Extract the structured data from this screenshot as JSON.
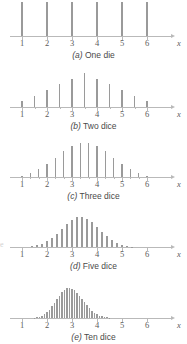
{
  "figure": {
    "title": "",
    "axis_color": "#b9b9b9",
    "bar_color": "#9a9a9a",
    "text_color": "#4a4a4a"
  },
  "chart_data": {
    "type": "bar",
    "xlabel": "x",
    "ylabel": "",
    "xlim": [
      0.5,
      6.8
    ],
    "grid": false,
    "legend": "none",
    "panels": [
      {
        "id": "a",
        "label": "(a)",
        "caption": "One die",
        "tick_labels": [
          "1",
          "2",
          "3",
          "4",
          "5",
          "6"
        ],
        "tick_values": [
          1,
          2,
          3,
          4,
          5,
          6
        ],
        "minor_ticks": [],
        "x": [
          1,
          2,
          3,
          4,
          5,
          6
        ],
        "values": [
          0.1667,
          0.1667,
          0.1667,
          0.1667,
          0.1667,
          0.1667
        ],
        "max_value": 0.1667,
        "bar_width_px": 1.3
      },
      {
        "id": "b",
        "label": "(b)",
        "caption": "Two dice",
        "tick_labels": [
          "1",
          "2",
          "3",
          "4",
          "5",
          "6"
        ],
        "tick_values": [
          1,
          2,
          3,
          4,
          5,
          6
        ],
        "minor_ticks": [
          1.5,
          2.5,
          3.5,
          4.5,
          5.5
        ],
        "x": [
          1,
          1.5,
          2,
          2.5,
          3,
          3.5,
          4,
          4.5,
          5,
          5.5,
          6
        ],
        "values": [
          0.0278,
          0.0556,
          0.0833,
          0.1111,
          0.1389,
          0.1667,
          0.1389,
          0.1111,
          0.0833,
          0.0556,
          0.0278
        ],
        "max_value": 0.1667,
        "bar_width_px": 1.3
      },
      {
        "id": "c",
        "label": "(c)",
        "caption": "Three dice",
        "tick_labels": [
          "1",
          "2",
          "3",
          "4",
          "5",
          "6"
        ],
        "tick_values": [
          1,
          2,
          3,
          4,
          5,
          6
        ],
        "minor_ticks": [
          1.333,
          1.667,
          2.333,
          2.667,
          3.333,
          3.667,
          4.333,
          4.667,
          5.333,
          5.667
        ],
        "x": [
          1,
          1.333,
          1.667,
          2,
          2.333,
          2.667,
          3,
          3.333,
          3.667,
          4,
          4.333,
          4.667,
          5,
          5.333,
          5.667,
          6
        ],
        "values": [
          0.00463,
          0.01389,
          0.02778,
          0.0463,
          0.06944,
          0.09722,
          0.11574,
          0.125,
          0.125,
          0.11574,
          0.09722,
          0.06944,
          0.0463,
          0.02778,
          0.01389,
          0.00463
        ],
        "max_value": 0.125,
        "bar_width_px": 1.3
      },
      {
        "id": "d",
        "label": "(d)",
        "caption": "Five dice",
        "tick_labels": [
          "1",
          "2",
          "3",
          "4",
          "5",
          "6"
        ],
        "tick_values": [
          1,
          2,
          3,
          4,
          5,
          6
        ],
        "minor_ticks": [],
        "x": [
          1,
          1.2,
          1.4,
          1.6,
          1.8,
          2,
          2.2,
          2.4,
          2.6,
          2.8,
          3,
          3.2,
          3.4,
          3.6,
          3.8,
          4,
          4.2,
          4.4,
          4.6,
          4.8,
          5,
          5.2,
          5.4,
          5.6,
          5.8,
          6
        ],
        "values": [
          0.0001,
          0.0006,
          0.0019,
          0.0045,
          0.009,
          0.0161,
          0.026,
          0.0386,
          0.0527,
          0.0668,
          0.0784,
          0.0855,
          0.0868,
          0.0818,
          0.0716,
          0.0584,
          0.0443,
          0.0311,
          0.0201,
          0.012,
          0.0064,
          0.0031,
          0.0013,
          0.0005,
          0.0001,
          3e-05
        ],
        "max_value": 0.0868,
        "bar_width_px": 1.6
      },
      {
        "id": "e",
        "label": "(e)",
        "caption": "Ten dice",
        "tick_labels": [
          "1",
          "2",
          "3",
          "4",
          "5",
          "6"
        ],
        "tick_values": [
          1,
          2,
          3,
          4,
          5,
          6
        ],
        "minor_ticks": [],
        "x": [
          1,
          1.1,
          1.2,
          1.3,
          1.4,
          1.5,
          1.6,
          1.7,
          1.8,
          1.9,
          2,
          2.1,
          2.2,
          2.3,
          2.4,
          2.5,
          2.6,
          2.7,
          2.8,
          2.9,
          3,
          3.1,
          3.2,
          3.3,
          3.4,
          3.5,
          3.6,
          3.7,
          3.8,
          3.9,
          4,
          4.1,
          4.2,
          4.3,
          4.4,
          4.5,
          4.6,
          4.7,
          4.8,
          4.9,
          5,
          5.1,
          5.2,
          5.3,
          5.4,
          5.5,
          5.6,
          5.7,
          5.8,
          5.9,
          6
        ],
        "values": [
          1e-05,
          3e-05,
          8e-05,
          0.0002,
          0.0005,
          0.0011,
          0.0022,
          0.004,
          0.0068,
          0.011,
          0.0167,
          0.024,
          0.0329,
          0.043,
          0.0536,
          0.0639,
          0.073,
          0.08,
          0.0843,
          0.0855,
          0.0837,
          0.079,
          0.0721,
          0.0636,
          0.0543,
          0.0448,
          0.0357,
          0.0275,
          0.0205,
          0.0148,
          0.0103,
          0.007,
          0.0045,
          0.0028,
          0.0017,
          0.001,
          0.0005,
          0.0003,
          0.00015,
          7e-05,
          3e-05,
          1e-05,
          5e-06,
          2e-06,
          1e-06,
          5e-07,
          2e-07,
          1e-07,
          5e-08,
          2e-08,
          1e-08
        ],
        "max_value": 0.0855,
        "bar_width_px": 1.6
      }
    ]
  },
  "edge_artifact": "e"
}
